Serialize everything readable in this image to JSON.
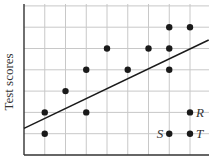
{
  "chart_data": {
    "type": "scatter",
    "title": "",
    "xlabel": "",
    "ylabel": "Test scores",
    "xlim": [
      0,
      9
    ],
    "ylim": [
      0,
      7
    ],
    "grid": true,
    "legend": null,
    "series": [
      {
        "name": "points",
        "points": [
          {
            "x": 1,
            "y": 1
          },
          {
            "x": 1,
            "y": 2
          },
          {
            "x": 2,
            "y": 3
          },
          {
            "x": 3,
            "y": 2
          },
          {
            "x": 3,
            "y": 4
          },
          {
            "x": 4,
            "y": 5
          },
          {
            "x": 5,
            "y": 4
          },
          {
            "x": 6,
            "y": 5
          },
          {
            "x": 7,
            "y": 6
          },
          {
            "x": 7,
            "y": 5
          },
          {
            "x": 7,
            "y": 4
          },
          {
            "x": 7,
            "y": 1,
            "label": "S"
          },
          {
            "x": 8,
            "y": 6
          },
          {
            "x": 8,
            "y": 2,
            "label": "R"
          },
          {
            "x": 8,
            "y": 1,
            "label": "T"
          }
        ]
      }
    ],
    "trend_line": {
      "x0": 0,
      "y0": 1.25,
      "x1": 8.9,
      "y1": 5.4
    },
    "annotations": [
      "R",
      "S",
      "T"
    ]
  },
  "colors": {
    "axis": "#333333",
    "grid": "#c8c8c8",
    "point": "#1a1a1a",
    "line": "#1a1a1a"
  }
}
